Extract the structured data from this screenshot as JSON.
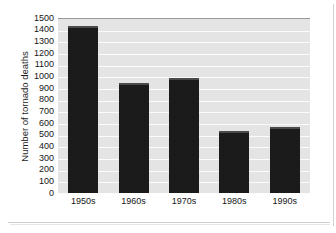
{
  "chart_data": {
    "type": "bar",
    "title": "",
    "xlabel": "",
    "ylabel": "Number of tornado deaths",
    "categories": [
      "1950s",
      "1960s",
      "1970s",
      "1980s",
      "1990s"
    ],
    "values": [
      1430,
      945,
      985,
      530,
      565
    ],
    "ylim": [
      0,
      1500
    ],
    "ytick_labels": [
      "1500",
      "1400",
      "1300",
      "1200",
      "1100",
      "1000",
      "900",
      "800",
      "700",
      "600",
      "500",
      "400",
      "300",
      "200",
      "100",
      "0"
    ],
    "ytick_values": [
      1500,
      1400,
      1300,
      1200,
      1100,
      1000,
      900,
      800,
      700,
      600,
      500,
      400,
      300,
      200,
      100,
      0
    ],
    "ytick_step": 100,
    "grid": true,
    "grid_orientation": "horizontal",
    "legend": false,
    "legend_position": "none",
    "bar_color": "#1b1b1b",
    "plot_background": "#e4e4e4",
    "gridline_color": "#fbfbfb",
    "page_background": "#ffffff"
  }
}
